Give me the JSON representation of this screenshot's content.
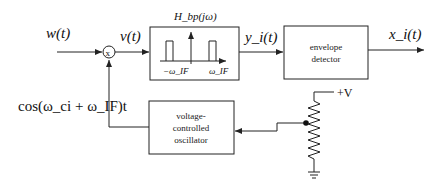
{
  "diagram": {
    "signals": {
      "input": "w(t)",
      "mixer_output": "v(t)",
      "filter_output": "y_i(t)",
      "output": "x_i(t)",
      "lo_signal": "cos(ω_ci + ω_IF)t"
    },
    "blocks": {
      "mixer": {
        "symbol": "x"
      },
      "bandpass_filter": {
        "title": "H_bp(jω)",
        "neg_freq": "−ω_IF",
        "pos_freq": "ω_IF"
      },
      "envelope_detector": {
        "line1": "envelope",
        "line2": "detector"
      },
      "vco": {
        "line1": "voltage-",
        "line2": "controlled",
        "line3": "oscillator"
      },
      "potentiometer": {
        "supply": "+V"
      }
    },
    "colors": {
      "stroke": "#222222",
      "background": "#ffffff"
    }
  }
}
